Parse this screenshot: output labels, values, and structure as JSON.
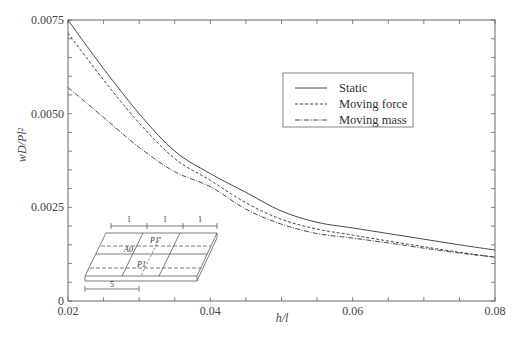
{
  "chart_data": {
    "type": "line",
    "title": "",
    "xlabel": "h/l",
    "ylabel": "wD/Pl²",
    "xlim": [
      0.02,
      0.08
    ],
    "ylim": [
      0,
      0.0075
    ],
    "grid": false,
    "legend_position": "upper right (inside plot)",
    "x_ticks": [
      "0.02",
      "0.04",
      "0.06",
      "0.08"
    ],
    "y_ticks": [
      "0",
      "0.0025",
      "0.0050",
      "0.0075"
    ],
    "x": [
      0.02,
      0.025,
      0.03,
      0.035,
      0.04,
      0.045,
      0.05,
      0.055,
      0.06,
      0.065,
      0.07,
      0.075,
      0.08
    ],
    "series": [
      {
        "name": "Static",
        "style": "solid",
        "values": [
          0.0075,
          0.0062,
          0.005,
          0.004,
          0.0034,
          0.0029,
          0.0024,
          0.0021,
          0.00195,
          0.0018,
          0.00165,
          0.0015,
          0.00136
        ]
      },
      {
        "name": "Moving force",
        "style": "dashed",
        "values": [
          0.00715,
          0.0059,
          0.00475,
          0.0038,
          0.00322,
          0.00262,
          0.00218,
          0.00192,
          0.00176,
          0.0016,
          0.00145,
          0.0013,
          0.00117
        ]
      },
      {
        "name": "Moving mass",
        "style": "dash-dot",
        "values": [
          0.0057,
          0.0049,
          0.0041,
          0.00345,
          0.00305,
          0.00245,
          0.00205,
          0.0018,
          0.00168,
          0.00155,
          0.00141,
          0.00128,
          0.00117
        ]
      }
    ],
    "inset": {
      "description": "Plate diagram with moving loads",
      "labels": {
        "span": "1",
        "offset": "5",
        "load_upper": "P1'",
        "load_lower": "P1",
        "point": "A0"
      }
    }
  },
  "legend": {
    "items": [
      {
        "label": "Static",
        "dash": ""
      },
      {
        "label": "Moving force",
        "dash": "3,2"
      },
      {
        "label": "Moving mass",
        "dash": "5,1.5,1,1.5"
      }
    ]
  },
  "colors": {
    "axis": "#555555",
    "line": "#333333",
    "background": "#ffffff"
  }
}
